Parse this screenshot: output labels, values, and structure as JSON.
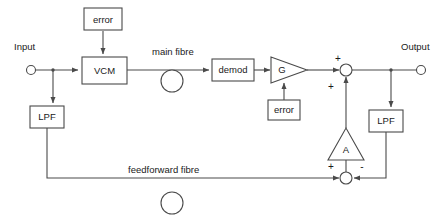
{
  "diagram": {
    "colors": {
      "line": "#4a4a4a",
      "text": "#1a1a1a",
      "background": "#ffffff"
    },
    "blocks": [
      {
        "id": "error_top",
        "label": "error",
        "x": 84,
        "y": 8,
        "w": 38,
        "h": 22
      },
      {
        "id": "vcm",
        "label": "VCM",
        "x": 82,
        "y": 57,
        "w": 45,
        "h": 27
      },
      {
        "id": "demod",
        "label": "demod",
        "x": 212,
        "y": 59,
        "w": 42,
        "h": 22
      },
      {
        "id": "error_bot",
        "label": "error",
        "x": 268,
        "y": 100,
        "w": 32,
        "h": 20
      },
      {
        "id": "lpf_left",
        "label": "LPF",
        "x": 30,
        "y": 106,
        "w": 34,
        "h": 22
      },
      {
        "id": "lpf_right",
        "label": "LPF",
        "x": 369,
        "y": 110,
        "w": 34,
        "h": 22
      }
    ],
    "amplifiers": [
      {
        "id": "gain_g",
        "label": "G",
        "direction": "right",
        "x": 271,
        "y": 58,
        "w": 36,
        "h": 26
      },
      {
        "id": "gain_a",
        "label": "A",
        "direction": "up",
        "x": 328,
        "y": 128,
        "w": 36,
        "h": 32
      }
    ],
    "summing_nodes": [
      {
        "id": "sum_output",
        "cx": 346,
        "cy": 70,
        "r": 6,
        "signs": [
          {
            "label": "+",
            "x": 338,
            "y": 59
          },
          {
            "label": "+",
            "x": 331,
            "y": 87
          }
        ]
      },
      {
        "id": "sum_feedback",
        "cx": 346,
        "cy": 178,
        "r": 6,
        "signs": [
          {
            "label": "+",
            "x": 331,
            "y": 167
          },
          {
            "label": "-",
            "x": 362,
            "y": 167
          }
        ]
      }
    ],
    "terminals": [
      {
        "id": "input_terminal",
        "label": "Input",
        "cx": 31,
        "cy": 70,
        "r": 4,
        "label_x": 14,
        "label_y": 47
      },
      {
        "id": "output_terminal",
        "label": "Output",
        "cx": 421,
        "cy": 70,
        "r": 4,
        "label_x": 403,
        "label_y": 47
      }
    ],
    "fibre_coils": [
      {
        "id": "main_fibre_coil",
        "cx": 172,
        "cy": 81,
        "r": 11
      },
      {
        "id": "feedforward_fibre_coil",
        "cx": 172,
        "cy": 203,
        "r": 11
      }
    ],
    "wire_labels": [
      {
        "id": "main_fibre_label",
        "text": "main fibre",
        "x": 152,
        "y": 52
      },
      {
        "id": "feedforward_fibre_label",
        "text": "feedforward fibre",
        "x": 128,
        "y": 170
      }
    ],
    "paths": {
      "input_to_split": "M 36 70 L 75 70",
      "split_to_vcm": "M 75 70 L 78 70",
      "split_down_to_lpf": "M 53 70 L 53 103",
      "error_top_to_vcm": "M 103 31 L 103 54",
      "vcm_to_coil": "M 127 70 L 208 70",
      "demod_to_gain": "M 254 70 L 268 70",
      "error_bot_to_gain": "M 284 99 L 284 82",
      "gain_to_sum": "M 307 70 L 340 70",
      "sum_to_output": "M 352 70 L 416 70",
      "output_tap_down": "M 391 70 L 391 107",
      "lpf_right_down": "M 386 132 L 386 178 L 353 178",
      "gain_a_to_sum_fb": "M 346 160 L 346 172",
      "sum_fb_up_to_sum_out": "M 346 95 L 346 76",
      "lpf_left_down": "M 47 128 L 47 178 L 340 178"
    }
  }
}
